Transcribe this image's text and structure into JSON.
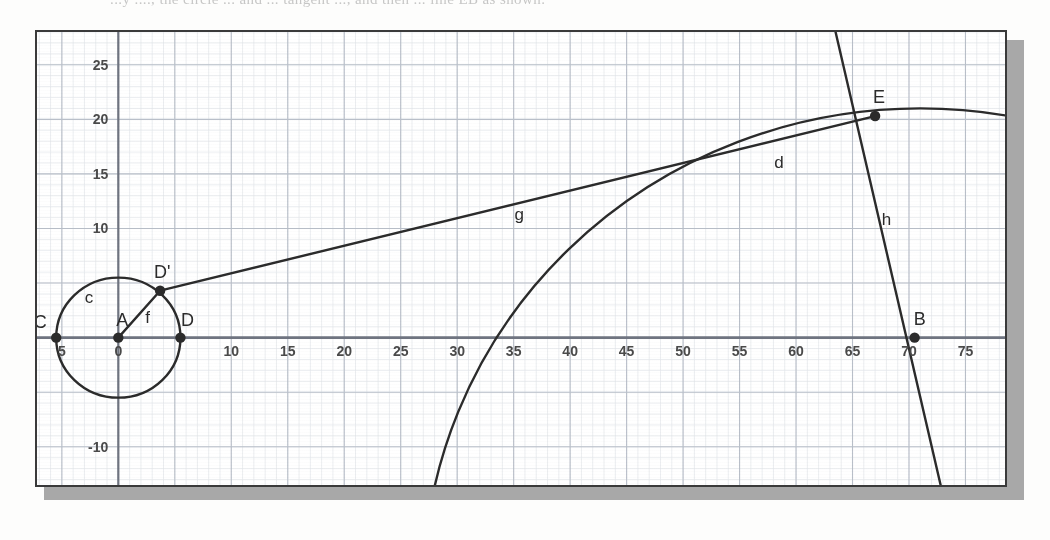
{
  "document": {
    "top_text_fragment": "...y ...., the circle ... and ... tangent ..., and then ... line EB as shown.",
    "figure_title": "Geometric construction on graph paper"
  },
  "figure": {
    "frame_color": "#3a3a3a",
    "shadow_color": "#a8a8a8",
    "paper_color": "#ffffff",
    "grid_major_color": "#b9bfc9",
    "grid_minor_color": "#e2e5ea",
    "axis_color": "#6f7480",
    "ink_color": "#2b2b2b",
    "label_color": "#2b2b2b"
  },
  "axes": {
    "x_label_values": [
      "5",
      "0",
      "10",
      "15",
      "20",
      "25",
      "30",
      "35",
      "40",
      "45",
      "50",
      "55",
      "60",
      "65",
      "70",
      "75"
    ],
    "x_tick_positions": [
      -5,
      0,
      10,
      15,
      20,
      25,
      30,
      35,
      40,
      45,
      50,
      55,
      60,
      65,
      70,
      75
    ],
    "y_label_values": [
      "25",
      "20",
      "15",
      "10",
      "5",
      "0",
      "-5",
      "-10"
    ],
    "y_tick_positions": [
      25,
      20,
      15,
      10,
      5,
      0,
      -5,
      -10
    ],
    "y_labels_visible": [
      "25",
      "20",
      "15",
      "10",
      "0",
      "-10"
    ],
    "x_range": [
      -7.2,
      78.5
    ],
    "y_range": [
      -13.5,
      28.0
    ],
    "grid_major_step": 5,
    "grid_minor_step": 1
  },
  "chart_data": {
    "type": "scatter",
    "xlabel": "",
    "ylabel": "",
    "xlim": [
      -7.2,
      78.5
    ],
    "ylim": [
      -13.5,
      28.0
    ],
    "grid": true,
    "legend": "none",
    "points": [
      {
        "name": "C",
        "label": "C",
        "x": -5.5,
        "y": 0.0,
        "label_dx": -16,
        "label_dy": -10,
        "marked": true
      },
      {
        "name": "A",
        "label": "A",
        "x": 0.0,
        "y": 0.0,
        "label_dx": 4,
        "label_dy": -12,
        "marked": true
      },
      {
        "name": "D",
        "label": "D",
        "x": 5.5,
        "y": 0.0,
        "label_dx": 7,
        "label_dy": -12,
        "marked": true
      },
      {
        "name": "Dp",
        "label": "D'",
        "x": 3.7,
        "y": 4.3,
        "label_dx": 2,
        "label_dy": -13,
        "marked": true
      },
      {
        "name": "E",
        "label": "E",
        "x": 67.0,
        "y": 20.3,
        "label_dx": 4,
        "label_dy": -13,
        "marked": true
      },
      {
        "name": "B",
        "label": "B",
        "x": 70.5,
        "y": 0.0,
        "label_dx": 5,
        "label_dy": -13,
        "marked": true
      }
    ],
    "curves": [
      {
        "name": "c",
        "label": "c",
        "type": "circle",
        "cx": 0.0,
        "cy": 0.0,
        "r": 5.5,
        "label_x": -2.6,
        "label_y": 3.2
      },
      {
        "name": "d",
        "label": "d",
        "type": "circle",
        "cx": 71.0,
        "cy": -23.0,
        "r": 44.0,
        "label_x": 58.5,
        "label_y": 15.5
      }
    ],
    "segments": [
      {
        "name": "f",
        "label": "f",
        "x1": 0.0,
        "y1": 0.0,
        "x2": 3.7,
        "y2": 4.3,
        "label_x": 2.6,
        "label_y": 1.3
      },
      {
        "name": "g",
        "label": "g",
        "x1": 3.7,
        "y1": 4.3,
        "x2": 67.0,
        "y2": 20.3,
        "label_x": 35.5,
        "label_y": 10.8
      },
      {
        "name": "h",
        "label": "h",
        "x1": 63.5,
        "y1": 28.0,
        "x2": 72.8,
        "y2": -13.5,
        "label_x": 68.0,
        "label_y": 10.3
      }
    ]
  }
}
